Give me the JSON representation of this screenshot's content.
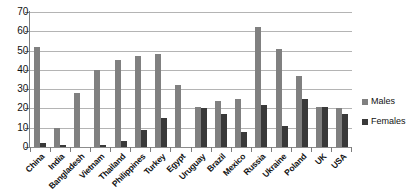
{
  "chart_data": {
    "type": "bar",
    "title": "",
    "subtitle": "",
    "xlabel": "",
    "ylabel": "",
    "ylim": [
      0,
      70
    ],
    "yticks": [
      0,
      10,
      20,
      30,
      40,
      50,
      60,
      70
    ],
    "grid": true,
    "legend_position": "right",
    "categories": [
      "China",
      "India",
      "Bangladesh",
      "Vietnam",
      "Thailand",
      "Philippines",
      "Turkey",
      "Egypt",
      "Uruguay",
      "Brazil",
      "Mexico",
      "Russia",
      "Ukraine",
      "Poland",
      "UK",
      "USA"
    ],
    "series": [
      {
        "name": "Males",
        "color": "#808080",
        "values": [
          52,
          10,
          28,
          40,
          45,
          47,
          48,
          32,
          21,
          24,
          25,
          62,
          51,
          37,
          21,
          20
        ]
      },
      {
        "name": "Females",
        "color": "#393939",
        "values": [
          2,
          1,
          0,
          1,
          3,
          9,
          15,
          0,
          20,
          17,
          8,
          22,
          11,
          25,
          21,
          17
        ]
      }
    ]
  },
  "legend": {
    "items": [
      {
        "label": "Males",
        "color": "#808080"
      },
      {
        "label": "Females",
        "color": "#393939"
      }
    ]
  },
  "axis": {
    "y_tick_labels": [
      "70",
      "60",
      "50",
      "40",
      "30",
      "20",
      "10",
      "0"
    ]
  }
}
